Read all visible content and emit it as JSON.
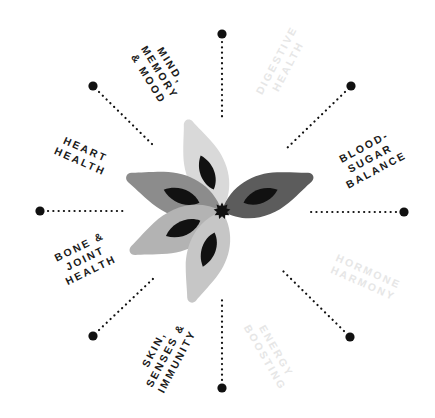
{
  "diagram": {
    "center": {
      "x": 222,
      "y": 211
    },
    "colors": {
      "text_active": "#1a1a1a",
      "text_faded": "#e6e6e6",
      "dot": "#111111",
      "center_star": "#111111",
      "petal_inner": "#111111"
    },
    "spokes": [
      {
        "id": "top",
        "dot": [
          222,
          34
        ],
        "line": [
          [
            222,
            42
          ],
          [
            222,
            120
          ]
        ]
      },
      {
        "id": "top-right",
        "dot": [
          351,
          86
        ],
        "line": [
          [
            345,
            92
          ],
          [
            285,
            150
          ]
        ]
      },
      {
        "id": "right",
        "dot": [
          404,
          212
        ],
        "line": [
          [
            396,
            212
          ],
          [
            307,
            212
          ]
        ]
      },
      {
        "id": "bottom-right",
        "dot": [
          350,
          337
        ],
        "line": [
          [
            344,
            331
          ],
          [
            282,
            270
          ]
        ]
      },
      {
        "id": "bottom",
        "dot": [
          222,
          388
        ],
        "line": [
          [
            222,
            380
          ],
          [
            222,
            296
          ]
        ]
      },
      {
        "id": "bottom-left",
        "dot": [
          93,
          336
        ],
        "line": [
          [
            99,
            330
          ],
          [
            156,
            276
          ]
        ]
      },
      {
        "id": "left",
        "dot": [
          40,
          211
        ],
        "line": [
          [
            48,
            211
          ],
          [
            127,
            211
          ]
        ]
      },
      {
        "id": "top-left",
        "dot": [
          93,
          86
        ],
        "line": [
          [
            99,
            92
          ],
          [
            154,
            146
          ]
        ]
      }
    ],
    "labels": [
      {
        "id": "mind",
        "lines": [
          "MIND,",
          "MEMORY",
          "& MOOD"
        ],
        "x": 160,
        "y": 72,
        "rotate": 58,
        "active": true
      },
      {
        "id": "digestive",
        "lines": [
          "DIGESTIVE",
          "HEALTH"
        ],
        "x": 282,
        "y": 63,
        "rotate": -62,
        "active": false
      },
      {
        "id": "blood-sugar",
        "lines": [
          "BLOOD-",
          "SUGAR",
          "BALANCE"
        ],
        "x": 370,
        "y": 158,
        "rotate": -28,
        "active": true
      },
      {
        "id": "hormone",
        "lines": [
          "HORMONE",
          "HARMONY"
        ],
        "x": 366,
        "y": 277,
        "rotate": 24,
        "active": false
      },
      {
        "id": "energy",
        "lines": [
          "ENERGY",
          "BOOSTING"
        ],
        "x": 271,
        "y": 354,
        "rotate": 60,
        "active": false
      },
      {
        "id": "skin",
        "lines": [
          "SKIN,",
          "SENSES &",
          "IMMUNITY"
        ],
        "x": 165,
        "y": 355,
        "rotate": -62,
        "active": true
      },
      {
        "id": "bone",
        "lines": [
          "BONE &",
          "JOINT",
          "HEALTH"
        ],
        "x": 85,
        "y": 258,
        "rotate": -26,
        "active": true
      },
      {
        "id": "heart",
        "lines": [
          "HEART",
          "HEALTH"
        ],
        "x": 83,
        "y": 155,
        "rotate": 24,
        "active": true
      }
    ],
    "petals": [
      {
        "id": "petal-top",
        "color": "#d9d9d9",
        "angle": -111,
        "length": 96
      },
      {
        "id": "petal-upper-left",
        "color": "#8c8c8c",
        "angle": -160,
        "length": 100
      },
      {
        "id": "petal-lower-left",
        "color": "#b3b3b3",
        "angle": 156,
        "length": 99
      },
      {
        "id": "petal-bottom",
        "color": "#c6c6c6",
        "angle": 109,
        "length": 95
      },
      {
        "id": "petal-right",
        "color": "#5c5c5c",
        "angle": -21,
        "length": 96
      }
    ]
  }
}
